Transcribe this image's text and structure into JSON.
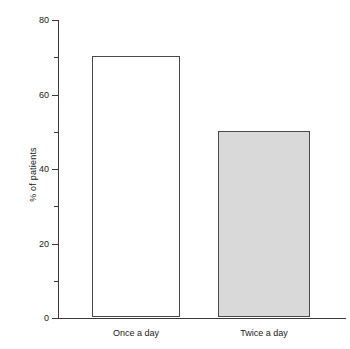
{
  "chart_data": {
    "type": "bar",
    "title": "",
    "subtitle": "",
    "xlabel": "",
    "ylabel": "% of patients",
    "categories": [
      "Once a day",
      "Twice a day"
    ],
    "values": [
      70,
      50
    ],
    "series": [
      {
        "name": "% of patients",
        "values": [
          70,
          50
        ]
      }
    ],
    "ylim": [
      0,
      80
    ],
    "ytick_major": [
      0,
      20,
      40,
      60,
      80
    ],
    "ytick_minor": [
      10,
      30,
      50,
      70
    ],
    "ytick_labels": [
      "0",
      "20",
      "40",
      "60",
      "80"
    ],
    "grid": false,
    "legend": false,
    "legend_position": "none",
    "bar_styles": [
      {
        "fill": "#ffffff",
        "edge": "#4a4a4a"
      },
      {
        "fill": "#d9d9d9",
        "edge": "#4a4a4a"
      }
    ],
    "axis_color": "#3a3a3a",
    "text_color": "#1a1a1a",
    "background": "#ffffff"
  }
}
